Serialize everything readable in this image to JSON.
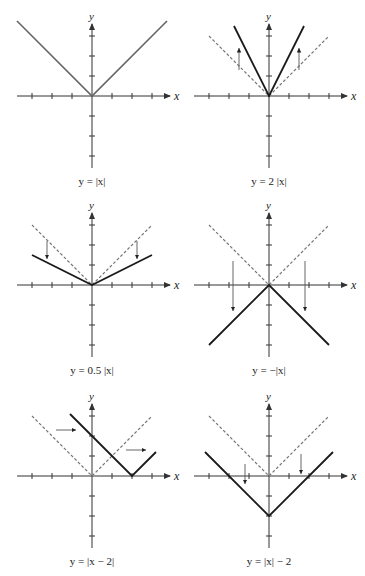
{
  "figure": {
    "axis_color": "#333333",
    "graph_color": "#1a1a1a",
    "first_graph_color": "#666666",
    "dashed_color": "#777777",
    "arrow_color": "#555555",
    "unit_px": 20,
    "tick_count": 3,
    "axis_x_label": "x",
    "axis_y_label": "y"
  },
  "panels": [
    {
      "id": "abs",
      "caption": "y = |x|",
      "origin": [
        92,
        96
      ],
      "fn": "abs",
      "a": 1,
      "h": 0,
      "k": 0,
      "xrange": [
        -3.75,
        3.75
      ],
      "show_parent": false,
      "arrows": [],
      "graph_color_key": "first_graph_color"
    },
    {
      "id": "stretch",
      "caption": "y = 2 |x|",
      "origin": [
        269,
        96
      ],
      "fn": "abs",
      "a": 2,
      "h": 0,
      "k": 0,
      "xrange": [
        -1.75,
        1.75
      ],
      "show_parent": true,
      "arrows": [
        [
          -1.5,
          1.3,
          -1.5,
          2.4
        ],
        [
          1.5,
          1.3,
          1.5,
          2.4
        ]
      ]
    },
    {
      "id": "shrink",
      "caption": "y = 0.5 |x|",
      "origin": [
        92,
        285
      ],
      "fn": "abs",
      "a": 0.5,
      "h": 0,
      "k": 0,
      "xrange": [
        -3,
        3
      ],
      "show_parent": true,
      "arrows": [
        [
          -2.25,
          2.2,
          -2.25,
          1.3
        ],
        [
          2.25,
          2.2,
          2.25,
          1.3
        ]
      ]
    },
    {
      "id": "reflect",
      "caption": "y = −|x|",
      "origin": [
        269,
        285
      ],
      "fn": "abs",
      "a": -1,
      "h": 0,
      "k": 0,
      "xrange": [
        -3,
        3
      ],
      "show_parent": true,
      "arrows": [
        [
          -1.8,
          1.2,
          -1.8,
          -1.3
        ],
        [
          1.8,
          1.2,
          1.8,
          -1.3
        ]
      ]
    },
    {
      "id": "hshift",
      "caption": "y = |x − 2|",
      "origin": [
        92,
        476
      ],
      "fn": "abs",
      "a": 1,
      "h": 2,
      "k": 0,
      "xrange": [
        -1.1,
        3.2
      ],
      "show_parent": true,
      "arrows": [
        [
          -1.8,
          2.3,
          -0.8,
          2.3
        ],
        [
          1.7,
          1.3,
          2.7,
          1.3
        ]
      ]
    },
    {
      "id": "vshift",
      "caption": "y = |x| − 2",
      "origin": [
        269,
        476
      ],
      "fn": "abs",
      "a": 1,
      "h": 0,
      "k": -2,
      "xrange": [
        -3.2,
        3.2
      ],
      "show_parent": true,
      "arrows": [
        [
          -1.2,
          0.6,
          -1.2,
          -0.4
        ],
        [
          1.6,
          1.1,
          1.6,
          0.1
        ]
      ]
    }
  ],
  "chart_data": [
    {
      "type": "line",
      "title": "y = |x|",
      "xlabel": "x",
      "ylabel": "y",
      "xlim": [
        -3,
        3
      ],
      "ylim": [
        -3,
        3
      ],
      "grid": false,
      "series": [
        {
          "name": "y = |x|",
          "x": [
            -3,
            0,
            3
          ],
          "y": [
            3,
            0,
            3
          ]
        }
      ]
    },
    {
      "type": "line",
      "title": "y = 2|x|",
      "xlabel": "x",
      "ylabel": "y",
      "xlim": [
        -3,
        3
      ],
      "ylim": [
        -3,
        3
      ],
      "grid": false,
      "series": [
        {
          "name": "y = 2|x|",
          "x": [
            -1.5,
            0,
            1.5
          ],
          "y": [
            3,
            0,
            3
          ]
        },
        {
          "name": "y = |x| (dashed)",
          "x": [
            -3,
            0,
            3
          ],
          "y": [
            3,
            0,
            3
          ]
        }
      ],
      "annotations": [
        "up arrows at x=±1.5"
      ]
    },
    {
      "type": "line",
      "title": "y = 0.5|x|",
      "xlabel": "x",
      "ylabel": "y",
      "xlim": [
        -3,
        3
      ],
      "ylim": [
        -3,
        3
      ],
      "grid": false,
      "series": [
        {
          "name": "y = 0.5|x|",
          "x": [
            -3,
            0,
            3
          ],
          "y": [
            1.5,
            0,
            1.5
          ]
        },
        {
          "name": "y = |x| (dashed)",
          "x": [
            -3,
            0,
            3
          ],
          "y": [
            3,
            0,
            3
          ]
        }
      ],
      "annotations": [
        "down arrows at x=±2.25"
      ]
    },
    {
      "type": "line",
      "title": "y = -|x|",
      "xlabel": "x",
      "ylabel": "y",
      "xlim": [
        -3,
        3
      ],
      "ylim": [
        -3,
        3
      ],
      "grid": false,
      "series": [
        {
          "name": "y = -|x|",
          "x": [
            -3,
            0,
            3
          ],
          "y": [
            -3,
            0,
            -3
          ]
        },
        {
          "name": "y = |x| (dashed)",
          "x": [
            -3,
            0,
            3
          ],
          "y": [
            3,
            0,
            3
          ]
        }
      ],
      "annotations": [
        "down arrows at x=±1.8"
      ]
    },
    {
      "type": "line",
      "title": "y = |x - 2|",
      "xlabel": "x",
      "ylabel": "y",
      "xlim": [
        -3,
        3
      ],
      "ylim": [
        -3,
        3
      ],
      "grid": false,
      "series": [
        {
          "name": "y = |x-2|",
          "x": [
            -1,
            2,
            3
          ],
          "y": [
            3,
            0,
            1
          ]
        },
        {
          "name": "y = |x| (dashed)",
          "x": [
            -3,
            0,
            3
          ],
          "y": [
            3,
            0,
            3
          ]
        }
      ],
      "annotations": [
        "right arrows"
      ]
    },
    {
      "type": "line",
      "title": "y = |x| - 2",
      "xlabel": "x",
      "ylabel": "y",
      "xlim": [
        -3,
        3
      ],
      "ylim": [
        -3,
        3
      ],
      "grid": false,
      "series": [
        {
          "name": "y = |x|-2",
          "x": [
            -3,
            0,
            3
          ],
          "y": [
            1,
            -2,
            1
          ]
        },
        {
          "name": "y = |x| (dashed)",
          "x": [
            -3,
            0,
            3
          ],
          "y": [
            3,
            0,
            3
          ]
        }
      ],
      "annotations": [
        "down arrows"
      ]
    }
  ]
}
